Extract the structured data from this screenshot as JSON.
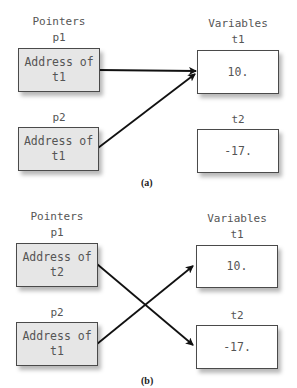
{
  "panels": [
    {
      "caption": "(a)",
      "pointers_header": "Pointers",
      "variables_header": "Variables",
      "pointers": [
        {
          "name": "p1",
          "line1": "Address of",
          "line2": "t1"
        },
        {
          "name": "p2",
          "line1": "Address of",
          "line2": "t1"
        }
      ],
      "variables": [
        {
          "name": "t1",
          "value": "10."
        },
        {
          "name": "t2",
          "value": "-17."
        }
      ],
      "arrows": [
        {
          "from": "p1",
          "to": "t1"
        },
        {
          "from": "p2",
          "to": "t1"
        }
      ]
    },
    {
      "caption": "(b)",
      "pointers_header": "Pointers",
      "variables_header": "Variables",
      "pointers": [
        {
          "name": "p1",
          "line1": "Address of",
          "line2": "t2"
        },
        {
          "name": "p2",
          "line1": "Address of",
          "line2": "t1"
        }
      ],
      "variables": [
        {
          "name": "t1",
          "value": "10."
        },
        {
          "name": "t2",
          "value": "-17."
        }
      ],
      "arrows": [
        {
          "from": "p1",
          "to": "t2"
        },
        {
          "from": "p2",
          "to": "t1"
        }
      ]
    }
  ],
  "colors": {
    "pointer_fill": "#e6e6e6",
    "variable_fill": "#ffffff",
    "arrow": "#111111"
  }
}
